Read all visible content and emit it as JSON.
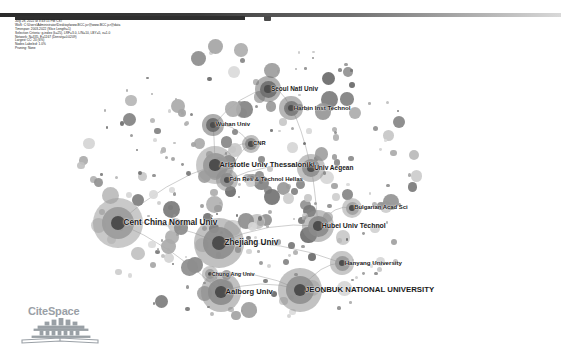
{
  "app": {
    "name": "CiteSpace",
    "logo_text": "CiteSpace",
    "logo_icon": "citespace-temple-book-icon"
  },
  "toolbar": {
    "name": "top-toolbar-strip",
    "knob_label": ""
  },
  "metadata": {
    "lines": [
      "CiteSpace, v. 6.1.R2 (64-bit) Basic",
      "July 28, 2022 at 3:43:15 PM CST",
      "WoS: C:\\Users\\Administrator\\Desktop\\www.BCC.jcr@www.BCC.jcr@data",
      "Timespan: 2003-2022 (Slice Length=1)",
      "Selection Criteria: g-index (k=25), LRF=3.0, L/N=10, LBY=5, e=1.0",
      "Network: N=335, E=1167 (Density=0.0209)",
      "Largest CC: 20 (6%)",
      "Nodes Labeled: 1.0%",
      "Pruning: None"
    ]
  },
  "chart_data": {
    "type": "scatter",
    "xlabel": "",
    "ylabel": "",
    "legend_position": "none",
    "grid": false,
    "labeled_nodes": [
      {
        "label": "Seoul Natl Univ",
        "x": 268,
        "y": 69,
        "r": 8.5,
        "shade": "#6f6f6f"
      },
      {
        "label": "Harbin Inst Technol",
        "x": 291,
        "y": 88,
        "r": 7.5,
        "shade": "#7a7a7a"
      },
      {
        "label": "Wuhan Univ",
        "x": 213,
        "y": 105,
        "r": 7.0,
        "shade": "#6a6a6a"
      },
      {
        "label": "CNR",
        "x": 251,
        "y": 124,
        "r": 6.0,
        "shade": "#8a8a8a"
      },
      {
        "label": "Aristotle Univ Thessaloniki",
        "x": 215,
        "y": 145,
        "r": 12.5,
        "shade": "#9a9a9a"
      },
      {
        "label": "Univ Aegean",
        "x": 311,
        "y": 148,
        "r": 9.0,
        "shade": "#8f8f8f"
      },
      {
        "label": "Fdn Res & Technol Hellas",
        "x": 227,
        "y": 160,
        "r": 7.0,
        "shade": "#8d8d8d"
      },
      {
        "label": "Bulgarian Acad Sci",
        "x": 352,
        "y": 188,
        "r": 6.5,
        "shade": "#a0a0a0"
      },
      {
        "label": "Cent China Normal Univ",
        "x": 118,
        "y": 203,
        "r": 16.0,
        "shade": "#9c9c9c"
      },
      {
        "label": "Hubei Univ Technol",
        "x": 318,
        "y": 206,
        "r": 10.5,
        "shade": "#8b8b8b"
      },
      {
        "label": "Zhejiang Univ",
        "x": 219,
        "y": 223,
        "r": 16.0,
        "shade": "#8e8e8e"
      },
      {
        "label": "Hanyang University",
        "x": 342,
        "y": 243,
        "r": 7.5,
        "shade": "#999999"
      },
      {
        "label": "Chung Ang Univ",
        "x": 210,
        "y": 254,
        "r": 5.0,
        "shade": "#9f9f9f"
      },
      {
        "label": "JEONBUK NATIONAL UNIVERSITY",
        "x": 300,
        "y": 270,
        "r": 14.0,
        "shade": "#909090"
      },
      {
        "label": "Aalborg Univ",
        "x": 221,
        "y": 272,
        "r": 13.0,
        "shade": "#8c8c8c"
      }
    ],
    "node_count": 335,
    "edge_count": 1167
  }
}
